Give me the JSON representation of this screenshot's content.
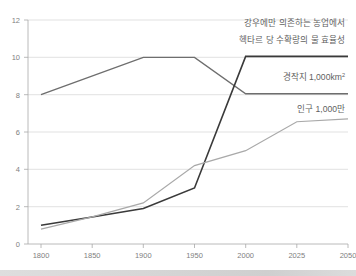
{
  "chart_data": {
    "type": "line",
    "title": "",
    "xlabel": "",
    "ylabel": "",
    "x": [
      1800,
      1850,
      1900,
      1950,
      2000,
      2025,
      2050
    ],
    "xticklabels": [
      "1800",
      "1850",
      "1900",
      "1950",
      "2000",
      "2025",
      "2050"
    ],
    "yticklabels": [
      "0",
      "2",
      "4",
      "6",
      "8",
      "10",
      "12"
    ],
    "yticks": [
      0,
      2,
      4,
      6,
      8,
      10,
      12
    ],
    "ylim": [
      0,
      12
    ],
    "grid": "horizontal",
    "legend_position": "inline-annotations",
    "series": [
      {
        "name": "강우에만 의존하는 농업에서 헥타르 당 수확량의 물 효율성",
        "color": "#6e6e6e",
        "x": [
          1800,
          1900,
          1950,
          2000,
          2050
        ],
        "values": [
          8.0,
          10.0,
          10.0,
          8.05,
          8.05
        ]
      },
      {
        "name": "경작지 1,000km²",
        "color": "#3a3a3a",
        "x": [
          1800,
          1850,
          1900,
          1950,
          2000,
          2050
        ],
        "values": [
          1.0,
          1.45,
          1.9,
          3.0,
          10.05,
          10.05
        ]
      },
      {
        "name": "인구 1,000만",
        "color": "#a9a9a9",
        "x": [
          1800,
          1850,
          1900,
          1950,
          2000,
          2025,
          2050
        ],
        "values": [
          0.8,
          1.45,
          2.2,
          4.2,
          5.0,
          6.55,
          6.7
        ]
      }
    ],
    "annotations": [
      {
        "id": "water-efficiency",
        "line1": "강우에만 의존하는 농업에서",
        "line2": "헥타르 당 수확량의 물 효율성"
      },
      {
        "id": "cultivated-land",
        "text": "경작지 1,000km",
        "superscript": "2"
      },
      {
        "id": "population",
        "text": "인구 1,000만"
      }
    ]
  },
  "colors": {
    "background": "#ffffff",
    "gridline": "#d4d4d4",
    "axis": "#a8a8a8",
    "tick_text": "#808080",
    "annotation_text": "#5f5f5f",
    "series_water_efficiency": "#6e6e6e",
    "series_cultivated_land": "#3a3a3a",
    "series_population": "#a9a9a9",
    "bottom_bar": "#d6d6d6"
  }
}
